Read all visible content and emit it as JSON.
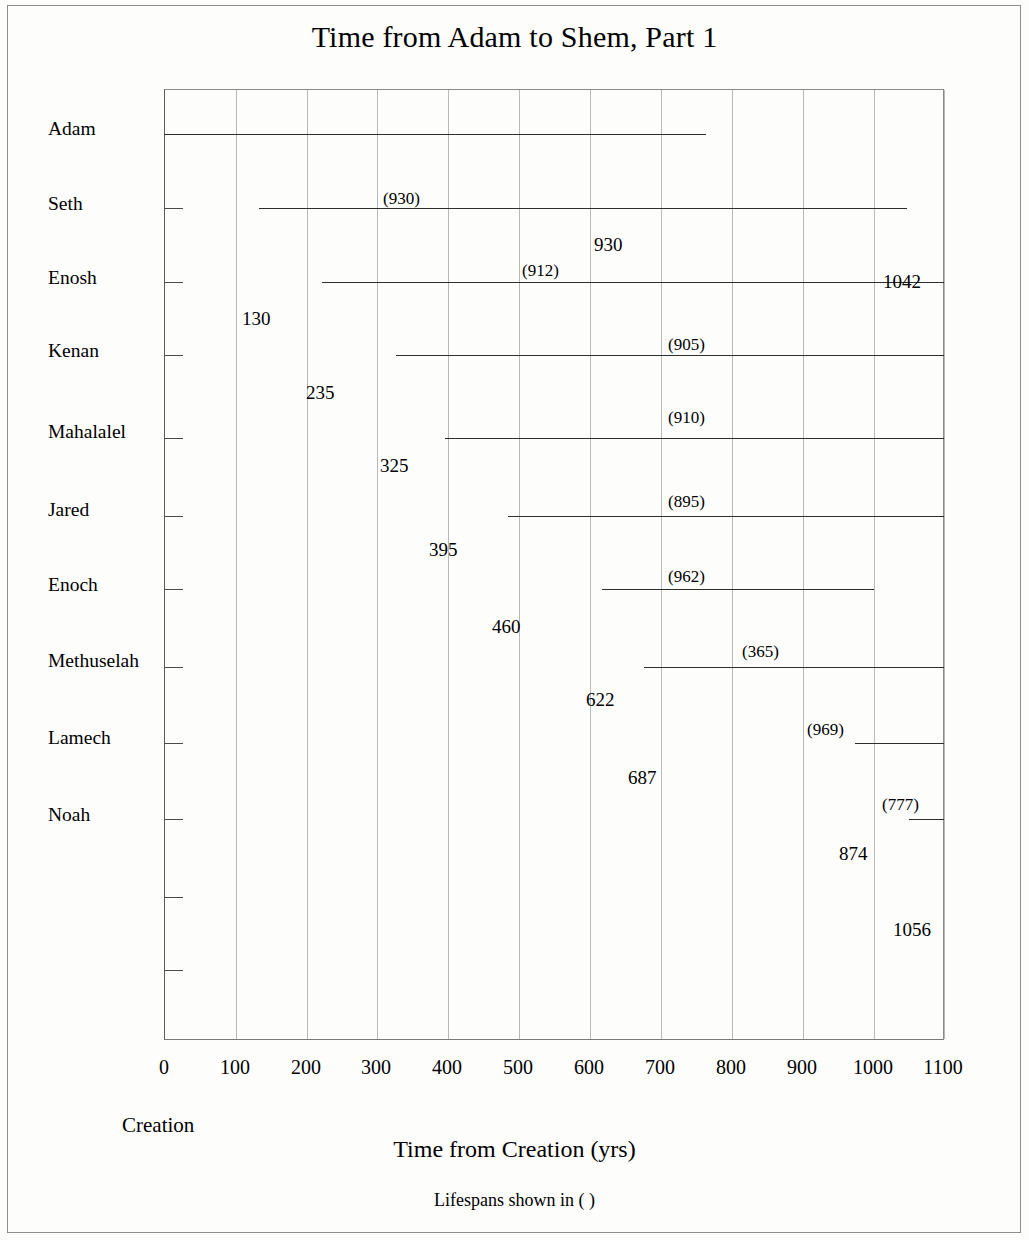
{
  "chart_title": "Time from Adam to Shem, Part 1",
  "x_axis_title": "Time from Creation   (yrs)",
  "footnote": "Lifespans shown in (  )",
  "creation_marker": "Creation",
  "chart_data": {
    "type": "bar",
    "orientation": "horizontal",
    "title": "Time from Adam to Shem, Part 1",
    "subtitle": "Lifespans shown in (  )",
    "xlabel": "Time from Creation   (yrs)",
    "ylabel": "",
    "xlim": [
      0,
      1100
    ],
    "ylim": [
      0,
      12
    ],
    "grid": "vertical",
    "legend": "none",
    "note": "Horizontal timeline bars; each bar starts at birth year from Creation and spans the lifespan. Bars that extend past 1100 are clipped at the plot right edge.",
    "x_ticks": [
      0,
      100,
      200,
      300,
      400,
      500,
      600,
      700,
      800,
      900,
      1000,
      1100
    ],
    "x_tick_labels": [
      "0",
      "100",
      "200",
      "300",
      "400",
      "500",
      "600",
      "700",
      "800",
      "900",
      "1000",
      "1100"
    ],
    "categories": [
      "Adam",
      "Seth",
      "Enosh",
      "Kenan",
      "Mahalalel",
      "Jared",
      "Enoch",
      "Methuselah",
      "Lamech",
      "Noah"
    ],
    "series": [
      {
        "name": "Lifespan timeline",
        "points": [
          {
            "name": "Adam",
            "birth": 0,
            "lifespan": 930,
            "death": 930,
            "birth_label": "",
            "death_label": "930",
            "lifespan_label": "(930)",
            "bar_px_start": 0,
            "bar_px_end": 541,
            "clipped": false
          },
          {
            "name": "Seth",
            "birth": 130,
            "lifespan": 912,
            "death": 1042,
            "birth_label": "130",
            "death_label": "1042",
            "lifespan_label": "(912)",
            "bar_px_start": 94,
            "bar_px_end": 742,
            "clipped": false
          },
          {
            "name": "Enosh",
            "birth": 235,
            "lifespan": 905,
            "death": 1140,
            "birth_label": "235",
            "death_label": "",
            "lifespan_label": "(905)",
            "bar_px_start": 157,
            "bar_px_end": 779,
            "clipped": true
          },
          {
            "name": "Kenan",
            "birth": 325,
            "lifespan": 910,
            "death": 1235,
            "birth_label": "325",
            "death_label": "",
            "lifespan_label": "(910)",
            "bar_px_start": 231,
            "bar_px_end": 779,
            "clipped": true
          },
          {
            "name": "Mahalalel",
            "birth": 395,
            "lifespan": 895,
            "death": 1290,
            "birth_label": "395",
            "death_label": "",
            "lifespan_label": "(895)",
            "bar_px_start": 280,
            "bar_px_end": 779,
            "clipped": true
          },
          {
            "name": "Jared",
            "birth": 460,
            "lifespan": 962,
            "death": 1422,
            "birth_label": "460",
            "death_label": "",
            "lifespan_label": "(962)",
            "bar_px_start": 343,
            "bar_px_end": 779,
            "clipped": true
          },
          {
            "name": "Enoch",
            "birth": 622,
            "lifespan": 365,
            "death": 987,
            "birth_label": "622",
            "death_label": "",
            "lifespan_label": "(365)",
            "bar_px_start": 437,
            "bar_px_end": 709,
            "clipped": false
          },
          {
            "name": "Methuselah",
            "birth": 687,
            "lifespan": 969,
            "death": 1656,
            "birth_label": "687",
            "death_label": "",
            "lifespan_label": "(969)",
            "bar_px_start": 479,
            "bar_px_end": 779,
            "clipped": true
          },
          {
            "name": "Lamech",
            "birth": 874,
            "lifespan": 777,
            "death": 1651,
            "birth_label": "874",
            "death_label": "",
            "lifespan_label": "(777)",
            "bar_px_start": 690,
            "bar_px_end": 779,
            "clipped": true
          },
          {
            "name": "Noah",
            "birth": 1056,
            "lifespan": 950,
            "death": 2006,
            "birth_label": "1056",
            "death_label": "",
            "lifespan_label": "",
            "bar_px_start": 744,
            "bar_px_end": 779,
            "clipped": true
          }
        ]
      }
    ]
  },
  "rows": [
    {
      "name": "Adam",
      "y": 133,
      "name_top": 118,
      "bar_left": 0,
      "bar_right": 541,
      "lifespan": "(930)",
      "lifespan_left": 219,
      "lifespan_top": 100,
      "start": "",
      "start_left": 0,
      "start_top": 0,
      "end": "930",
      "end_left": 430,
      "end_top": 145
    },
    {
      "name": "Seth",
      "y": 207,
      "name_top": 193,
      "bar_left": 94,
      "bar_right": 742,
      "lifespan": "(912)",
      "lifespan_left": 358,
      "lifespan_top": 172,
      "start": "130",
      "start_left": 78,
      "start_top": 219,
      "end": "1042",
      "end_left": 719,
      "end_top": 182
    },
    {
      "name": "Enosh",
      "y": 281,
      "name_top": 267,
      "bar_left": 157,
      "bar_right": 779,
      "lifespan": "(905)",
      "lifespan_left": 504,
      "lifespan_top": 246,
      "start": "235",
      "start_left": 142,
      "start_top": 293,
      "end": "",
      "end_left": 0,
      "end_top": 0
    },
    {
      "name": "Kenan",
      "y": 354,
      "name_top": 340,
      "bar_left": 231,
      "bar_right": 779,
      "lifespan": "(910)",
      "lifespan_left": 504,
      "lifespan_top": 319,
      "start": "325",
      "start_left": 216,
      "start_top": 366,
      "end": "",
      "end_left": 0,
      "end_top": 0
    },
    {
      "name": "Mahalalel",
      "y": 437,
      "name_top": 421,
      "bar_left": 280,
      "bar_right": 779,
      "lifespan": "(895)",
      "lifespan_left": 504,
      "lifespan_top": 403,
      "start": "395",
      "start_left": 265,
      "start_top": 450,
      "end": "",
      "end_left": 0,
      "end_top": 0
    },
    {
      "name": "Jared",
      "y": 515,
      "name_top": 499,
      "bar_left": 343,
      "bar_right": 779,
      "lifespan": "(962)",
      "lifespan_left": 504,
      "lifespan_top": 478,
      "start": "460",
      "start_left": 328,
      "start_top": 527,
      "end": "",
      "end_left": 0,
      "end_top": 0
    },
    {
      "name": "Enoch",
      "y": 588,
      "name_top": 574,
      "bar_left": 437,
      "bar_right": 709,
      "lifespan": "(365)",
      "lifespan_left": 578,
      "lifespan_top": 553,
      "start": "622",
      "start_left": 422,
      "start_top": 600,
      "end": "",
      "end_left": 0,
      "end_top": 0
    },
    {
      "name": "Methuselah",
      "y": 666,
      "name_top": 650,
      "bar_left": 479,
      "bar_right": 779,
      "lifespan": "(969)",
      "lifespan_left": 643,
      "lifespan_top": 631,
      "start": "687",
      "start_left": 464,
      "start_top": 678,
      "end": "",
      "end_left": 0,
      "end_top": 0
    },
    {
      "name": "Lamech",
      "y": 742,
      "name_top": 727,
      "bar_left": 690,
      "bar_right": 779,
      "lifespan": "(777)",
      "lifespan_left": 718,
      "lifespan_top": 706,
      "start": "874",
      "start_left": 675,
      "start_top": 754,
      "end": "",
      "end_left": 0,
      "end_top": 0
    },
    {
      "name": "Noah",
      "y": 818,
      "name_top": 804,
      "bar_left": 744,
      "bar_right": 779,
      "lifespan": "",
      "lifespan_left": 0,
      "lifespan_top": 0,
      "start": "1056",
      "start_left": 729,
      "start_top": 830,
      "end": "",
      "end_left": 0,
      "end_top": 0
    }
  ],
  "extra_ticks_y": [
    896,
    969
  ],
  "x_ticks": [
    {
      "label": "0",
      "px": 0
    },
    {
      "label": "100",
      "px": 71
    },
    {
      "label": "200",
      "px": 142
    },
    {
      "label": "300",
      "px": 212
    },
    {
      "label": "400",
      "px": 283
    },
    {
      "label": "500",
      "px": 354
    },
    {
      "label": "600",
      "px": 425
    },
    {
      "label": "700",
      "px": 496
    },
    {
      "label": "800",
      "px": 567
    },
    {
      "label": "900",
      "px": 638
    },
    {
      "label": "1000",
      "px": 709
    },
    {
      "label": "1100",
      "px": 779
    }
  ]
}
